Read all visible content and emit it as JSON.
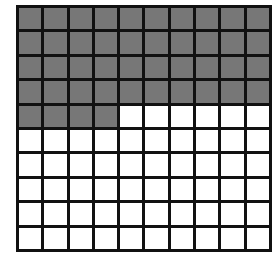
{
  "diagram": {
    "type": "hundred-grid",
    "rows": 10,
    "columns": 10,
    "total_cells": 100,
    "shaded_cells": 44,
    "shaded_color": "#777777",
    "unshaded_color": "#ffffff",
    "line_color": "#111111",
    "shaded_fraction": "44/100"
  }
}
